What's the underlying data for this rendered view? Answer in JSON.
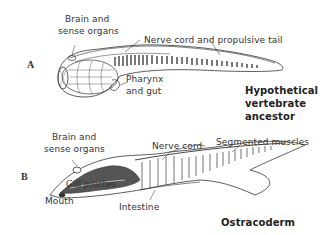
{
  "figure": {
    "panel_a": {
      "letter": "A",
      "title_lines": [
        "Hypothetical",
        "vertebrate",
        "ancestor"
      ],
      "labels": {
        "brain_line1": "Brain and",
        "brain_line2": "sense organs",
        "nerve_cord": "Nerve cord and propulsive tail",
        "pharynx_line1": "Pharynx",
        "pharynx_line2": "and gut"
      }
    },
    "panel_b": {
      "letter": "B",
      "title": "Ostracoderm",
      "labels": {
        "brain_line1": "Brain and",
        "brain_line2": "sense organs",
        "nerve_cord": "Nerve cord",
        "segmented_muscles": "Segmented muscles",
        "gill_pouches": "Gill pouches",
        "mouth": "Mouth",
        "intestine": "Intestine"
      }
    },
    "colors": {
      "ink": "#333333",
      "background": "#ffffff"
    }
  }
}
